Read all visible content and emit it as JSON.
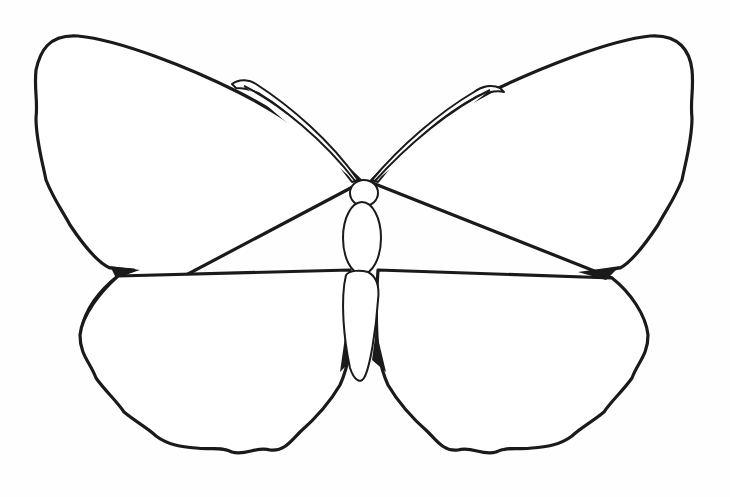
{
  "image": {
    "subject": "Butterfly outline drawing",
    "background_color": "#ffffff",
    "line_color": "#1a1a1a"
  },
  "butterfly": {
    "parts": [
      {
        "name": "left-forewing",
        "d": "M362,182 C330,150 290,118 238,92 C190,68 120,40 78,36 C48,34 40,52 36,70 C34,90 38,100 36,118 C36,140 42,160 46,180 C54,200 62,210 70,225 C80,240 96,262 110,268 L134,270 L118,276 C100,290 84,310 82,330 Z"
      },
      {
        "name": "left-hindwing",
        "d": "M118,276 C100,292 82,315 80,335 C80,355 90,362 96,378 C106,392 116,400 124,412 C136,422 148,428 156,436 C168,445 182,447 196,448 C210,450 220,446 232,452 C246,456 256,446 270,450 C284,452 292,440 300,432 C316,418 330,402 340,385 C346,372 348,362 350,350 C352,330 352,300 350,270 Z"
      },
      {
        "name": "right-forewing",
        "d": "M370,182 C400,150 440,118 490,92 C540,68 610,40 650,36 C680,34 690,52 692,70 C694,90 690,100 692,118 C692,140 686,160 682,180 C674,200 666,210 658,225 C648,240 632,262 620,268 L596,272 L612,278 Z"
      },
      {
        "name": "right-hindwing",
        "d": "M612,278 C630,292 646,315 648,335 C648,355 638,362 632,378 C622,392 612,400 604,412 C592,422 580,428 572,436 C560,445 546,447 532,448 C518,450 508,446 496,452 C482,456 472,446 458,450 C444,452 436,440 428,432 C412,418 398,402 388,385 C382,372 380,362 378,350 C376,330 376,300 378,270 Z"
      }
    ],
    "body": {
      "head": {
        "cx": 364,
        "cy": 193,
        "rx": 14,
        "ry": 13
      },
      "thorax": {
        "cx": 362,
        "cy": 238,
        "rx": 19,
        "ry": 36
      },
      "abdomen": {
        "d": "M346,275 C340,300 344,340 350,368 C354,380 360,384 364,378 C370,368 376,330 378,300 C380,286 376,276 368,272 C360,270 350,270 346,275 Z"
      }
    },
    "antennae_left": {
      "d": "M232,84 C240,78 250,80 256,84 C290,106 330,140 358,180 L352,182 C326,146 290,112 260,94 C252,90 244,88 236,88 Z"
    },
    "antennae_right": {
      "d": "M500,88 C492,84 482,86 474,92 C440,112 400,146 372,180 L378,182 C404,148 444,114 478,96 C488,92 496,90 504,92 Z"
    }
  }
}
